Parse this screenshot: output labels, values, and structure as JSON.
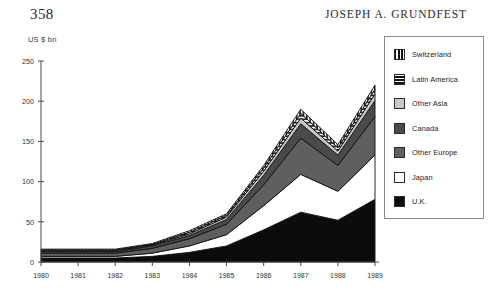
{
  "runhead": {
    "folio": "358",
    "author": "JOSEPH A. GRUNDFEST"
  },
  "chart_data": {
    "type": "area",
    "stacked": true,
    "title": "",
    "xlabel": "",
    "ylabel": "US $ bn",
    "ylim": [
      0,
      250
    ],
    "yticks": [
      0,
      50,
      100,
      150,
      200,
      250
    ],
    "grid": false,
    "legend_position": "right",
    "categories": [
      "1980",
      "1981",
      "1982",
      "1983",
      "1984",
      "1985",
      "1986",
      "1987",
      "1988",
      "1989"
    ],
    "x": [
      1980,
      1981,
      1982,
      1983,
      1984,
      1985,
      1986,
      1987,
      1988,
      1989
    ],
    "series": [
      {
        "name": "U.K.",
        "color": "#0c0c0c",
        "pattern": "solid",
        "values": [
          5,
          5,
          5,
          7,
          12,
          20,
          40,
          62,
          52,
          78
        ]
      },
      {
        "name": "Japan",
        "color": "#ffffff",
        "pattern": "solid",
        "values": [
          2,
          2,
          2,
          4,
          8,
          14,
          30,
          47,
          36,
          55
        ]
      },
      {
        "name": "Other Europe",
        "color": "#5f5f5f",
        "pattern": "solid",
        "values": [
          4,
          4,
          4,
          6,
          9,
          13,
          26,
          45,
          32,
          48
        ]
      },
      {
        "name": "Canada",
        "color": "#4a4a4a",
        "pattern": "solid",
        "values": [
          2,
          2,
          2,
          3,
          4,
          6,
          12,
          18,
          13,
          20
        ]
      },
      {
        "name": "Other Asia",
        "color": "#c9c9c9",
        "pattern": "solid",
        "values": [
          1,
          1,
          1,
          1,
          2,
          3,
          5,
          7,
          5,
          8
        ]
      },
      {
        "name": "Latin America",
        "color": "#2a2a2a",
        "pattern": "horizontal-stripes",
        "values": [
          1,
          1,
          1,
          1,
          2,
          2,
          4,
          6,
          4,
          6
        ]
      },
      {
        "name": "Switzerland",
        "color": "#2a2a2a",
        "pattern": "vertical-stripes",
        "values": [
          1,
          1,
          1,
          1,
          2,
          2,
          3,
          5,
          4,
          5
        ]
      }
    ],
    "totals": [
      16,
      16,
      16,
      23,
      39,
      60,
      120,
      190,
      146,
      220
    ],
    "legend": [
      {
        "label": "Switzerland",
        "swatch": "sw-switzerland"
      },
      {
        "label": "Latin America",
        "swatch": "sw-latin"
      },
      {
        "label": "Other Asia",
        "swatch": "sw-otherasia"
      },
      {
        "label": "Canada",
        "swatch": "sw-canada"
      },
      {
        "label": "Other Europe",
        "swatch": "sw-othereurope"
      },
      {
        "label": "Japan",
        "swatch": "sw-japan"
      },
      {
        "label": "U.K.",
        "swatch": "sw-uk"
      }
    ]
  }
}
